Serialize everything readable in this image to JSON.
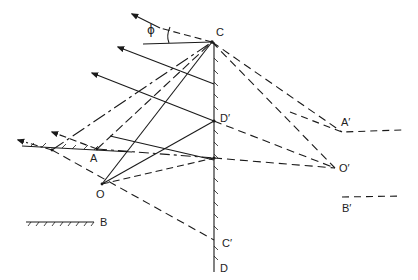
{
  "diagram": {
    "type": "optics ray diagram",
    "stroke_color": "#1a1a1a",
    "background": "#ffffff",
    "labels": {
      "phi": "ϕ",
      "C": "C",
      "D_prime": "D′",
      "A": "A",
      "O": "O",
      "C_prime": "C′",
      "D": "D",
      "A_prime": "A′",
      "O_prime": "O′",
      "B": "B",
      "B_prime": "B′"
    },
    "points": {
      "C": [
        212,
        42
      ],
      "D_prime": [
        214,
        121
      ],
      "A": [
        97,
        149
      ],
      "O": [
        102,
        184
      ],
      "C_prime": [
        214,
        240
      ],
      "D": [
        214,
        270
      ],
      "A_prime": [
        338,
        132
      ],
      "O_prime": [
        335,
        168
      ]
    }
  }
}
